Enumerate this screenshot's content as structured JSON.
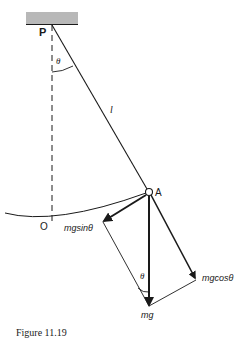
{
  "figure": {
    "caption": "Figure 11.19",
    "labels": {
      "pivot": "P",
      "bob": "A",
      "origin": "O",
      "length": "l",
      "theta_top": "θ",
      "theta_bottom": "θ",
      "weight": "mg",
      "tangential": "mgsinθ",
      "radial": "mgcosθ"
    },
    "colors": {
      "ink": "#1a1a1a",
      "ceiling": "#b8b8b8"
    }
  }
}
